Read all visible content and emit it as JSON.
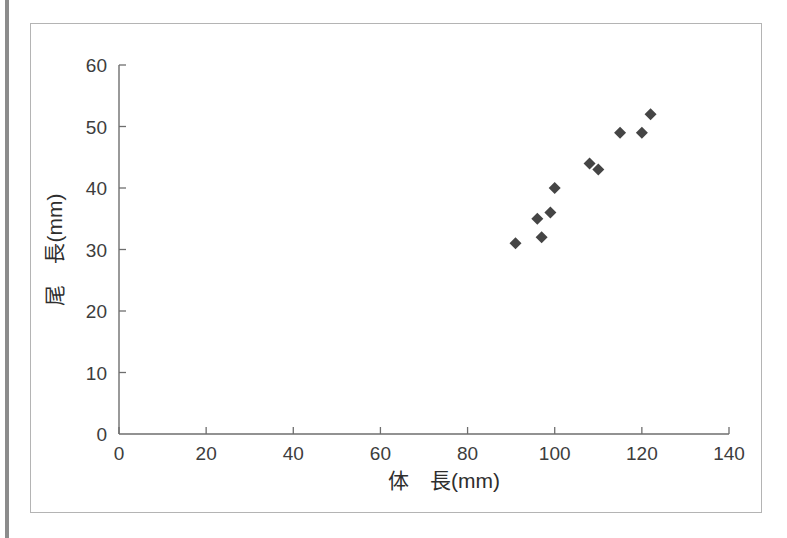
{
  "figure": {
    "background_color": "#ffffff",
    "frame_color": "#b4b4b4",
    "edge_bar_color": "#8c8c8c"
  },
  "chart_data": {
    "type": "scatter",
    "title": "",
    "subtitle": "",
    "xlabel": "体　長(mm)",
    "ylabel": "尾　長(mm)",
    "xlim": [
      0,
      140
    ],
    "ylim": [
      0,
      60
    ],
    "xticks": [
      0,
      20,
      40,
      60,
      80,
      100,
      120,
      140
    ],
    "yticks": [
      0,
      10,
      20,
      30,
      40,
      50,
      60
    ],
    "xticklabels": [
      "0",
      "20",
      "40",
      "60",
      "80",
      "100",
      "120",
      "140"
    ],
    "yticklabels": [
      "0",
      "10",
      "20",
      "30",
      "40",
      "50",
      "60"
    ],
    "grid": false,
    "legend": null,
    "marker": "diamond",
    "marker_color": "#454545",
    "marker_size": 9,
    "series": [
      {
        "name": "measurements",
        "points": [
          {
            "x": 91,
            "y": 31
          },
          {
            "x": 96,
            "y": 35
          },
          {
            "x": 97,
            "y": 32
          },
          {
            "x": 99,
            "y": 36
          },
          {
            "x": 100,
            "y": 40
          },
          {
            "x": 108,
            "y": 44
          },
          {
            "x": 110,
            "y": 43
          },
          {
            "x": 115,
            "y": 49
          },
          {
            "x": 120,
            "y": 49
          },
          {
            "x": 122,
            "y": 52
          }
        ]
      }
    ],
    "n_points": 10
  },
  "axis_titles": {
    "x": "体　長(mm)",
    "y": "尾　長(mm)"
  }
}
